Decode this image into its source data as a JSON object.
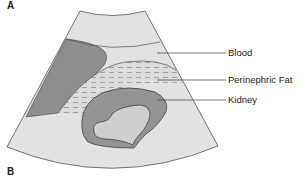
{
  "figure": {
    "panel_top": "A",
    "panel_bottom": "B",
    "labels": [
      {
        "key": "blood",
        "text": "Blood"
      },
      {
        "key": "fat",
        "text": "Perinephric Fat"
      },
      {
        "key": "kidney",
        "text": "Kidney"
      }
    ],
    "colors": {
      "background_fan": "#e2e2e2",
      "dark_region": "#8e8e8e",
      "kidney_cortex": "#949494",
      "kidney_inner": "#cfcfcf",
      "fat": "#dcdcdc",
      "fat_dashes": "#8a8a8a",
      "outline": "#555555"
    }
  }
}
